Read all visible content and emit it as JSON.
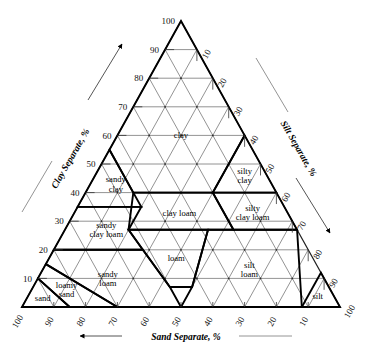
{
  "figure": {
    "background": "#ffffff",
    "grid_color": "#6f6f6f",
    "boundary_color": "#000000"
  },
  "axes": {
    "left": {
      "title": "Clay Separate, %",
      "arrow": "up-right",
      "ticks": [
        "100",
        "90",
        "80",
        "70",
        "60",
        "50",
        "40",
        "30",
        "20",
        "10"
      ]
    },
    "right": {
      "title": "Silt Separate, %",
      "arrow": "down-left",
      "ticks": [
        "10",
        "20",
        "30",
        "40",
        "50",
        "60",
        "70",
        "80",
        "90",
        "100"
      ]
    },
    "bottom": {
      "title": "Sand Separate, %",
      "arrow": "left",
      "ticks": [
        "100",
        "90",
        "80",
        "70",
        "60",
        "50",
        "40",
        "30",
        "20",
        "10"
      ]
    }
  },
  "chart_data": {
    "type": "ternary",
    "axis_titles": {
      "left": "Clay Separate, %",
      "right": "Silt Separate, %",
      "bottom": "Sand Separate, %"
    },
    "axis_range": [
      0,
      100
    ],
    "tick_step": 10,
    "grid": true,
    "legend": "none",
    "components": [
      "clay",
      "silt",
      "sand"
    ],
    "classes": [
      {
        "name": "clay",
        "label_lines": [
          "clay"
        ],
        "label_point": {
          "clay": 60,
          "silt": 20,
          "sand": 20
        },
        "vertices": [
          {
            "clay": 100,
            "silt": 0,
            "sand": 0
          },
          {
            "clay": 55,
            "silt": 0,
            "sand": 45
          },
          {
            "clay": 40,
            "silt": 15,
            "sand": 45
          },
          {
            "clay": 40,
            "silt": 40,
            "sand": 20
          },
          {
            "clay": 60,
            "silt": 40,
            "sand": 0
          }
        ]
      },
      {
        "name": "silty clay",
        "label_lines": [
          "silty",
          "clay"
        ],
        "label_point": {
          "clay": 46,
          "silt": 47,
          "sand": 7
        },
        "vertices": [
          {
            "clay": 60,
            "silt": 40,
            "sand": 0
          },
          {
            "clay": 40,
            "silt": 40,
            "sand": 20
          },
          {
            "clay": 40,
            "silt": 60,
            "sand": 0
          }
        ]
      },
      {
        "name": "sandy clay",
        "label_lines": [
          "sandy",
          "clay"
        ],
        "label_point": {
          "clay": 43,
          "silt": 8,
          "sand": 49
        },
        "vertices": [
          {
            "clay": 55,
            "silt": 0,
            "sand": 45
          },
          {
            "clay": 35,
            "silt": 0,
            "sand": 65
          },
          {
            "clay": 35,
            "silt": 20,
            "sand": 45
          },
          {
            "clay": 40,
            "silt": 15,
            "sand": 45
          }
        ]
      },
      {
        "name": "clay loam",
        "label_lines": [
          "clay loam"
        ],
        "label_point": {
          "clay": 33,
          "silt": 33,
          "sand": 34
        },
        "vertices": [
          {
            "clay": 40,
            "silt": 15,
            "sand": 45
          },
          {
            "clay": 40,
            "silt": 40,
            "sand": 20
          },
          {
            "clay": 27,
            "silt": 53,
            "sand": 20
          },
          {
            "clay": 27,
            "silt": 20,
            "sand": 53
          }
        ]
      },
      {
        "name": "silty clay loam",
        "label_lines": [
          "silty",
          "clay loam"
        ],
        "label_point": {
          "clay": 33,
          "silt": 56,
          "sand": 11
        },
        "vertices": [
          {
            "clay": 40,
            "silt": 40,
            "sand": 20
          },
          {
            "clay": 40,
            "silt": 60,
            "sand": 0
          },
          {
            "clay": 27,
            "silt": 73,
            "sand": 0
          },
          {
            "clay": 27,
            "silt": 53,
            "sand": 20
          }
        ]
      },
      {
        "name": "sandy clay loam",
        "label_lines": [
          "sandy",
          "clay loam"
        ],
        "label_point": {
          "clay": 27,
          "silt": 13,
          "sand": 60
        },
        "vertices": [
          {
            "clay": 35,
            "silt": 0,
            "sand": 65
          },
          {
            "clay": 35,
            "silt": 20,
            "sand": 45
          },
          {
            "clay": 27,
            "silt": 20,
            "sand": 53
          },
          {
            "clay": 20,
            "silt": 28,
            "sand": 52
          },
          {
            "clay": 20,
            "silt": 0,
            "sand": 80
          }
        ]
      },
      {
        "name": "loam",
        "label_lines": [
          "loam"
        ],
        "label_point": {
          "clay": 17,
          "silt": 40,
          "sand": 43
        },
        "vertices": [
          {
            "clay": 27,
            "silt": 20,
            "sand": 53
          },
          {
            "clay": 27,
            "silt": 45,
            "sand": 28
          },
          {
            "clay": 7,
            "silt": 50,
            "sand": 43
          },
          {
            "clay": 7,
            "silt": 43,
            "sand": 50
          },
          {
            "clay": 20,
            "silt": 28,
            "sand": 52
          }
        ]
      },
      {
        "name": "silt loam",
        "label_lines": [
          "silt",
          "loam"
        ],
        "label_point": {
          "clay": 13,
          "silt": 65,
          "sand": 22
        },
        "vertices": [
          {
            "clay": 27,
            "silt": 45,
            "sand": 28
          },
          {
            "clay": 27,
            "silt": 73,
            "sand": 0
          },
          {
            "clay": 0,
            "silt": 88,
            "sand": 12
          },
          {
            "clay": 0,
            "silt": 50,
            "sand": 50
          },
          {
            "clay": 7,
            "silt": 50,
            "sand": 43
          }
        ]
      },
      {
        "name": "silt",
        "label_lines": [
          "silt"
        ],
        "label_point": {
          "clay": 4,
          "silt": 91,
          "sand": 5
        },
        "vertices": [
          {
            "clay": 0,
            "silt": 100,
            "sand": 0
          },
          {
            "clay": 0,
            "silt": 88,
            "sand": 12
          },
          {
            "clay": 12,
            "silt": 88,
            "sand": 0
          }
        ]
      },
      {
        "name": "sandy loam",
        "label_lines": [
          "sandy",
          "loam"
        ],
        "label_point": {
          "clay": 10,
          "silt": 22,
          "sand": 68
        },
        "vertices": [
          {
            "clay": 20,
            "silt": 0,
            "sand": 80
          },
          {
            "clay": 20,
            "silt": 28,
            "sand": 52
          },
          {
            "clay": 7,
            "silt": 43,
            "sand": 50
          },
          {
            "clay": 0,
            "silt": 50,
            "sand": 50
          },
          {
            "clay": 0,
            "silt": 30,
            "sand": 70
          },
          {
            "clay": 15,
            "silt": 0,
            "sand": 85
          }
        ]
      },
      {
        "name": "loamy sand",
        "label_lines": [
          "loamy",
          "sand"
        ],
        "label_point": {
          "clay": 6,
          "silt": 11,
          "sand": 83
        },
        "vertices": [
          {
            "clay": 15,
            "silt": 0,
            "sand": 85
          },
          {
            "clay": 0,
            "silt": 30,
            "sand": 70
          },
          {
            "clay": 0,
            "silt": 15,
            "sand": 85
          },
          {
            "clay": 10,
            "silt": 0,
            "sand": 90
          }
        ]
      },
      {
        "name": "sand",
        "label_lines": [
          "sand"
        ],
        "label_point": {
          "clay": 3,
          "silt": 5,
          "sand": 92
        },
        "vertices": [
          {
            "clay": 10,
            "silt": 0,
            "sand": 90
          },
          {
            "clay": 0,
            "silt": 15,
            "sand": 85
          },
          {
            "clay": 0,
            "silt": 0,
            "sand": 100
          }
        ]
      }
    ]
  }
}
